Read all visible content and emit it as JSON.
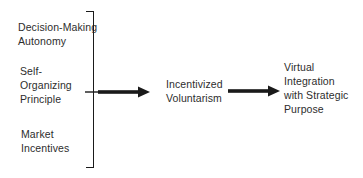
{
  "diagram": {
    "type": "flow",
    "inputs": [
      {
        "label": "Decision-Making\nAutonomy"
      },
      {
        "label": "Self-\nOrganizing\nPrinciple"
      },
      {
        "label": "Market\nIncentives"
      }
    ],
    "mediator": {
      "label": "Incentivized\nVoluntarism"
    },
    "outcome": {
      "label": "Virtual\nIntegration\nwith Strategic\nPurpose"
    },
    "connectors": {
      "bracket": "groups the three inputs",
      "arrow_1": "bracket to mediator",
      "arrow_2": "mediator to outcome"
    },
    "colors": {
      "background": "#ffffff",
      "text": "#2d2d2d",
      "line": "#1a1a1a"
    }
  }
}
